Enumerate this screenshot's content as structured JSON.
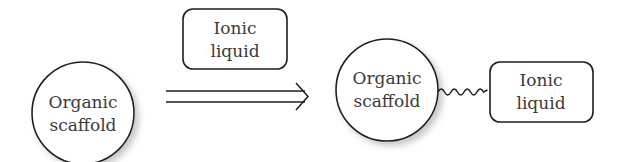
{
  "diagram": {
    "reactant": {
      "label_line1": "Organic",
      "label_line2": "scaffold"
    },
    "reagent": {
      "label_line1": "Ionic",
      "label_line2": "liquid"
    },
    "arrow": {
      "type": "double-line-arrow"
    },
    "product": {
      "scaffold": {
        "label_line1": "Organic",
        "label_line2": "scaffold"
      },
      "linker": {
        "type": "wavy-bond"
      },
      "ionic_liquid": {
        "label_line1": "Ionic",
        "label_line2": "liquid"
      }
    }
  }
}
